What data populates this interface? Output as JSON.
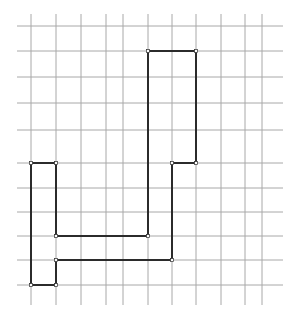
{
  "figure": {
    "title": "",
    "canvas": {
      "width": 298,
      "height": 314,
      "background": "#ffffff"
    },
    "grid": {
      "name": "square-grid",
      "color": "#a8a8a8",
      "stroke_width": 1,
      "x_start": 17,
      "x_end": 283,
      "y_start": 14,
      "y_end": 305,
      "vertical_lines_x": [
        31,
        56,
        81,
        106,
        123,
        148,
        172,
        196,
        221,
        245,
        262
      ],
      "horizontal_lines_y": [
        26,
        51,
        77,
        103,
        130,
        163,
        188,
        212,
        236,
        260,
        285
      ],
      "columns": 10,
      "rows": 10,
      "cell_width": 24,
      "cell_height": 26
    },
    "polygon": {
      "name": "outlined-polygon",
      "stroke_color": "#2b2b2b",
      "stroke_width": 2,
      "fill": "none",
      "closed": true,
      "vertices": [
        {
          "x": 148,
          "y": 51
        },
        {
          "x": 196,
          "y": 51
        },
        {
          "x": 196,
          "y": 163
        },
        {
          "x": 172,
          "y": 163
        },
        {
          "x": 172,
          "y": 260
        },
        {
          "x": 56,
          "y": 260
        },
        {
          "x": 56,
          "y": 285
        },
        {
          "x": 31,
          "y": 285
        },
        {
          "x": 31,
          "y": 163
        },
        {
          "x": 56,
          "y": 163
        },
        {
          "x": 56,
          "y": 236
        },
        {
          "x": 148,
          "y": 236
        }
      ],
      "vertex_marker": {
        "shape": "square",
        "size": 3,
        "fill": "#ffffff",
        "stroke": "#2b2b2b"
      }
    }
  },
  "chart_data": {
    "type": "scatter",
    "title": "",
    "xlabel": "",
    "ylabel": "",
    "grid": true,
    "legend": "none",
    "xlim": [
      17,
      283
    ],
    "ylim": [
      14,
      305
    ],
    "series": [
      {
        "name": "polygon-outline",
        "x": [
          148,
          196,
          196,
          172,
          172,
          56,
          56,
          31,
          31,
          56,
          56,
          148,
          148
        ],
        "y": [
          51,
          51,
          163,
          163,
          260,
          260,
          285,
          285,
          163,
          163,
          236,
          236,
          51
        ]
      }
    ]
  }
}
